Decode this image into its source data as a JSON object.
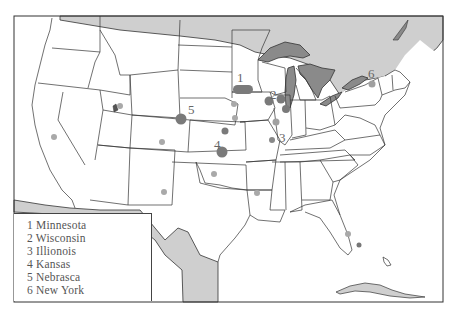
{
  "map": {
    "title": "",
    "region": "Contiguous United States",
    "colors": {
      "water": "#c9c9c9",
      "lakes": "#8a8a8a",
      "land": "#ffffff",
      "border": "#333333",
      "marker_dark": "#7a7a7a",
      "marker_light": "#a9a9a9"
    },
    "numbered_markers": [
      {
        "number": "1",
        "label_x": 237,
        "label_y": 82
      },
      {
        "number": "2",
        "label_x": 270,
        "label_y": 99
      },
      {
        "number": "3",
        "label_x": 279,
        "label_y": 142
      },
      {
        "number": "4",
        "label_x": 214,
        "label_y": 149
      },
      {
        "number": "5",
        "label_x": 188,
        "label_y": 114
      },
      {
        "number": "6",
        "label_x": 368,
        "label_y": 78
      }
    ]
  },
  "legend": {
    "items": [
      {
        "number": "1",
        "name": "Minnesota",
        "text": "1 Minnesota"
      },
      {
        "number": "2",
        "name": "Wisconsin",
        "text": "2 Wisconsin"
      },
      {
        "number": "3",
        "name": "Illionois",
        "text": "3 Illionois"
      },
      {
        "number": "4",
        "name": "Kansas",
        "text": "4 Kansas"
      },
      {
        "number": "5",
        "name": "Nebrasca",
        "text": "5 Nebrasca"
      },
      {
        "number": "6",
        "name": "New York",
        "text": "6 New York"
      }
    ]
  }
}
